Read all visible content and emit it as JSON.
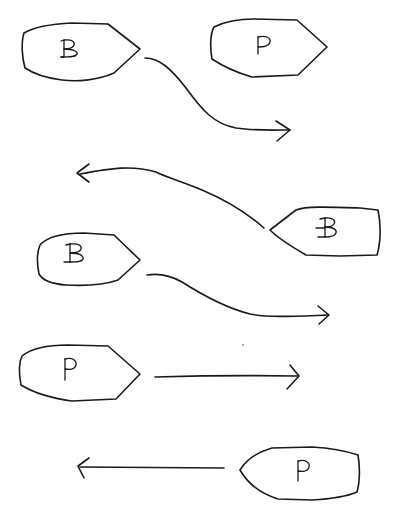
{
  "diagram": {
    "background": "#ffffff",
    "ink_color": "#1a1a1a",
    "style": "hand-drawn",
    "boats": [
      {
        "id": "boat-1",
        "label": "B",
        "variant": "plain",
        "facing": "right",
        "position": "top-left"
      },
      {
        "id": "boat-2",
        "label": "P",
        "variant": "plain",
        "facing": "right",
        "position": "top-right"
      },
      {
        "id": "boat-3",
        "label": "B",
        "variant": "barred",
        "facing": "left",
        "position": "middle-right"
      },
      {
        "id": "boat-4",
        "label": "B",
        "variant": "serif-foot",
        "facing": "right",
        "position": "middle-left"
      },
      {
        "id": "boat-5",
        "label": "P",
        "variant": "plain",
        "facing": "right",
        "position": "lower-left"
      },
      {
        "id": "boat-6",
        "label": "P",
        "variant": "plain",
        "facing": "left",
        "position": "bottom-right"
      }
    ],
    "arrows": [
      {
        "id": "arrow-1",
        "from": "boat-1",
        "direction": "right",
        "shape": "s-curve-down"
      },
      {
        "id": "arrow-2",
        "from": "boat-3",
        "direction": "left",
        "shape": "curve-up"
      },
      {
        "id": "arrow-3",
        "from": "boat-4",
        "direction": "right",
        "shape": "s-curve-down"
      },
      {
        "id": "arrow-4",
        "from": "boat-5",
        "direction": "right",
        "shape": "straight"
      },
      {
        "id": "arrow-5",
        "from": "boat-6",
        "direction": "left",
        "shape": "straight"
      }
    ]
  }
}
